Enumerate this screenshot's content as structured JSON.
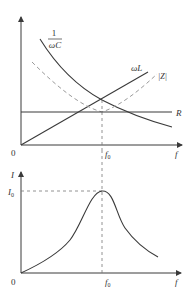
{
  "top_chart": {
    "curves": {
      "capacitive": {
        "label_num": "1",
        "label_den": "ωC"
      },
      "inductive": {
        "label": "ωL"
      },
      "impedance": {
        "label": "|Z|"
      },
      "resistance": {
        "label": "R"
      }
    },
    "origin_label": "0",
    "x_axis_label": "f",
    "resonance_label": "f",
    "resonance_sub": "0"
  },
  "bottom_chart": {
    "y_axis_label": "I",
    "peak_label": "I",
    "peak_sub": "0",
    "origin_label": "0",
    "x_axis_label": "f",
    "resonance_label": "f",
    "resonance_sub": "0"
  },
  "colors": {
    "solid": "#3a3a3a",
    "dashed": "#9a9a9a"
  }
}
